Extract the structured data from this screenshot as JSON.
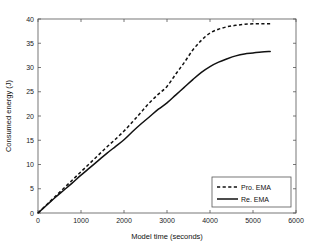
{
  "chart_data": {
    "type": "line",
    "title": "",
    "xlabel": "Model time (seconds)",
    "ylabel": "Consumed energy (J)",
    "xlim": [
      0,
      6000
    ],
    "ylim": [
      0,
      40
    ],
    "xticks": [
      0,
      1000,
      2000,
      3000,
      4000,
      5000,
      6000
    ],
    "xtick_labels": [
      "0",
      "1000",
      "2000",
      "3000",
      "4000",
      "5000",
      "6000"
    ],
    "yticks": [
      0,
      5,
      10,
      15,
      20,
      25,
      30,
      35,
      40
    ],
    "ytick_labels": [
      "0",
      "5",
      "10",
      "15",
      "20",
      "25",
      "30",
      "35",
      "40"
    ],
    "grid": false,
    "legend_position": "lower right",
    "series": [
      {
        "name": "Pro. EMA",
        "style": "dashed",
        "color": "#111111",
        "x": [
          0,
          200,
          400,
          600,
          800,
          1000,
          1200,
          1400,
          1600,
          1800,
          2000,
          2200,
          2400,
          2600,
          2800,
          3000,
          3200,
          3400,
          3600,
          3800,
          4000,
          4200,
          4400,
          4600,
          4800,
          5000,
          5200,
          5400
        ],
        "y": [
          0.0,
          1.7,
          3.4,
          5.1,
          6.8,
          8.5,
          10.2,
          11.9,
          13.6,
          15.2,
          16.9,
          18.8,
          20.8,
          22.8,
          24.5,
          26.1,
          28.6,
          31.0,
          33.6,
          35.6,
          37.1,
          37.9,
          38.4,
          38.7,
          38.9,
          39.0,
          39.0,
          39.0
        ]
      },
      {
        "name": "Re. EMA",
        "style": "solid",
        "color": "#111111",
        "x": [
          0,
          200,
          400,
          600,
          800,
          1000,
          1200,
          1400,
          1600,
          1800,
          2000,
          2200,
          2400,
          2600,
          2800,
          3000,
          3200,
          3400,
          3600,
          3800,
          4000,
          4200,
          4400,
          4600,
          4800,
          5000,
          5200,
          5400
        ],
        "y": [
          0.0,
          1.6,
          3.2,
          4.7,
          6.2,
          7.8,
          9.3,
          10.8,
          12.3,
          13.7,
          15.1,
          16.8,
          18.4,
          19.9,
          21.4,
          22.7,
          24.3,
          25.9,
          27.5,
          29.0,
          30.2,
          31.1,
          31.8,
          32.4,
          32.8,
          33.0,
          33.2,
          33.3
        ]
      }
    ],
    "legend": [
      {
        "label": "Pro. EMA",
        "style": "dashed"
      },
      {
        "label": "Re. EMA",
        "style": "solid"
      }
    ]
  },
  "axes": {
    "plot_left_px": 38,
    "plot_right_px": 296,
    "plot_top_px": 19,
    "plot_bottom_px": 213
  },
  "colors": {
    "line": "#111111",
    "axis": "#555555",
    "background": "#ffffff"
  }
}
